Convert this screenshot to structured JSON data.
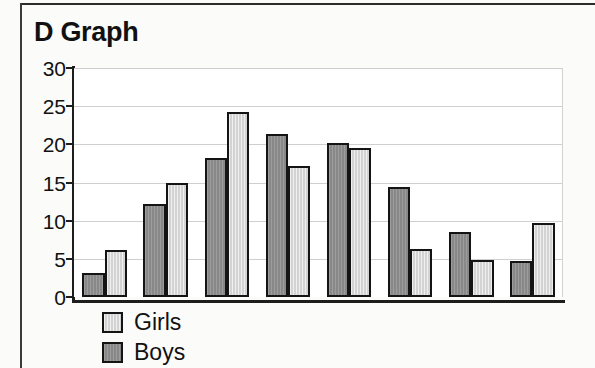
{
  "chart_data": {
    "type": "bar",
    "title": "D Graph",
    "xlabel": "",
    "ylabel": "",
    "ylim": [
      0,
      30
    ],
    "yticks": [
      0,
      5,
      10,
      15,
      20,
      25,
      30
    ],
    "ytick_labels": [
      "0",
      "5",
      "10",
      "15",
      "20",
      "25",
      "30"
    ],
    "grid": true,
    "legend_position": "below-axis-left",
    "categories": [
      "1",
      "2",
      "3",
      "4",
      "5",
      "6",
      "7",
      "8"
    ],
    "category_labels_visible": false,
    "series": [
      {
        "name": "Boys",
        "color": "#8f8f8f",
        "values": [
          3.1,
          12.2,
          18.2,
          21.3,
          20.2,
          14.4,
          8.5,
          4.7
        ]
      },
      {
        "name": "Girls",
        "color": "#dcdcdc",
        "values": [
          6.1,
          15.0,
          24.3,
          17.2,
          19.5,
          6.3,
          4.8,
          9.7
        ]
      }
    ]
  },
  "legend": {
    "entries": [
      {
        "label": "Girls",
        "swatch": "girls"
      },
      {
        "label": "Boys",
        "swatch": "boys"
      }
    ]
  },
  "colors": {
    "boys": "#8f8f8f",
    "girls": "#dcdcdc",
    "outline": "#141414",
    "axis": "#1d1d1d",
    "gridline": "#cfcfcf",
    "text": "#111111",
    "plot_background": "#ffffff",
    "page_background": "#fbfbfa"
  }
}
